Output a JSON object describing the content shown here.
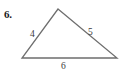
{
  "problem": {
    "number_label": "6."
  },
  "figure": {
    "name": "triangle",
    "stroke_color": "#6e6e6e",
    "background_color": "#ffffff",
    "text_color": "#3a3a3a",
    "number_color": "#1a1a1a",
    "vertices": {
      "apex": {
        "x": 58,
        "y": 9
      },
      "bottom_left": {
        "x": 22,
        "y": 58
      },
      "bottom_right": {
        "x": 117,
        "y": 58
      }
    },
    "sides": [
      {
        "name": "left-side",
        "label": "4",
        "from": "bottom_left",
        "to": "apex"
      },
      {
        "name": "right-side",
        "label": "5",
        "from": "apex",
        "to": "bottom_right"
      },
      {
        "name": "base",
        "label": "6",
        "from": "bottom_left",
        "to": "bottom_right"
      }
    ],
    "labels": {
      "left": "4",
      "right": "5",
      "base": "6"
    }
  }
}
